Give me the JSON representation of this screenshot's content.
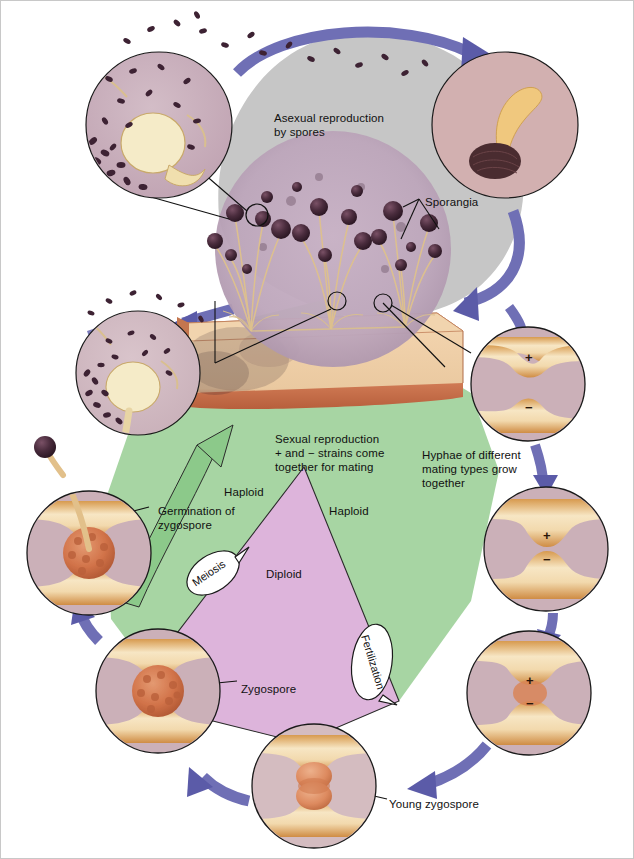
{
  "figure": {
    "title_visible": false,
    "background": "#ffffff",
    "border_color": "#c8c8c8"
  },
  "palette": {
    "asexual_field": "#c6c6c6",
    "sexual_field": "#a7d5a3",
    "diploid_field": "#ddb4db",
    "arrow_purple": "#6f6fb5",
    "arrow_green": "#8cc98a",
    "arrow_lavender": "#c6a9d6",
    "hypha_tan": "#e8b878",
    "hypha_light": "#f6e2bd",
    "zygospore_orange": "#d4724a",
    "sporangium_dark": "#3c2230",
    "bread_crust": "#cf7a57",
    "bread_crumb": "#f0cda8",
    "mold_mass": "#b9a1b4",
    "inset_fill": "#c6a8b8",
    "text": "#111111"
  },
  "labels": {
    "asexual": {
      "text": "Asexual reproduction\nby spores",
      "x": 273,
      "y": 110
    },
    "sporangia": {
      "text": "Sporangia",
      "x": 424,
      "y": 194
    },
    "sexual": {
      "text": "Sexual reproduction\n+ and − strains come\ntogether for mating",
      "x": 274,
      "y": 431
    },
    "hyphae_mating": {
      "text": "Hyphae of different\nmating types grow\ntogether",
      "x": 421,
      "y": 447
    },
    "haploid_left": {
      "text": "Haploid",
      "x": 223,
      "y": 484
    },
    "haploid_right": {
      "text": "Haploid",
      "x": 328,
      "y": 503
    },
    "diploid": {
      "text": "Diploid",
      "x": 265,
      "y": 566
    },
    "germination": {
      "text": "Germination of\nzygospore",
      "x": 157,
      "y": 503
    },
    "zygospore": {
      "text": "Zygospore",
      "x": 240,
      "y": 681
    },
    "young_zygospore": {
      "text": "Young zygospore",
      "x": 388,
      "y": 796
    }
  },
  "balloons": [
    {
      "name": "meiosis",
      "text": "Meiosis",
      "cx": 212,
      "cy": 572,
      "rx": 29,
      "ry": 18,
      "rotate": -34
    },
    {
      "name": "fertilization",
      "text": "Fertilization",
      "cx": 371,
      "cy": 661,
      "rx": 20,
      "ry": 38,
      "rotate": 73
    }
  ],
  "mating_signs": [
    {
      "name": "plus-sign-stage1",
      "symbol": "+",
      "x": 527,
      "y": 356
    },
    {
      "name": "minus-sign-stage1",
      "symbol": "−",
      "x": 527,
      "y": 406
    },
    {
      "name": "plus-sign-stage2",
      "symbol": "+",
      "x": 545,
      "y": 534
    },
    {
      "name": "minus-sign-stage2",
      "symbol": "−",
      "x": 545,
      "y": 558
    },
    {
      "name": "plus-sign-stage3",
      "symbol": "+",
      "x": 528,
      "y": 679
    },
    {
      "name": "minus-sign-stage3",
      "symbol": "−",
      "x": 528,
      "y": 702
    }
  ],
  "insets": [
    {
      "name": "inset-sporangium-bursting-top",
      "cx": 158,
      "cy": 124,
      "r": 73,
      "content": "ruptured sporangium releasing spores"
    },
    {
      "name": "inset-spore-germinating",
      "cx": 504,
      "cy": 124,
      "r": 73,
      "content": "germinating spore with germ tube"
    },
    {
      "name": "inset-sporangium-bursting-left",
      "cx": 137,
      "cy": 372,
      "r": 62,
      "content": "ruptured sporangium releasing spores"
    },
    {
      "name": "inset-mold-colony",
      "cx": 332,
      "cy": 248,
      "r": 118,
      "content": "sporangiophores bearing black sporangia on substrate"
    },
    {
      "name": "inset-hyphae-approach",
      "cx": 527,
      "cy": 383,
      "r": 57,
      "content": "plus and minus hyphae growing toward each other"
    },
    {
      "name": "inset-hyphae-contact",
      "cx": 545,
      "cy": 548,
      "r": 62,
      "content": "plus and minus hyphae in contact, gametangia forming"
    },
    {
      "name": "inset-fertilization",
      "cx": 528,
      "cy": 692,
      "r": 62,
      "content": "fusing gametangia at fertilization"
    },
    {
      "name": "inset-young-zygospore",
      "cx": 313,
      "cy": 785,
      "r": 62,
      "content": "young zygospore developing between suspensors"
    },
    {
      "name": "inset-zygospore",
      "cx": 157,
      "cy": 690,
      "r": 62,
      "content": "mature warty zygospore"
    },
    {
      "name": "inset-germinating-zygospore",
      "cx": 88,
      "cy": 552,
      "r": 62,
      "content": "germinating zygospore producing sporangiophore"
    }
  ],
  "cycle_arrows": [
    {
      "name": "arrow-asexual-top",
      "from": "sporangium burst",
      "to": "germinating spore",
      "color": "#6f6fb5"
    },
    {
      "name": "arrow-asexual-right-down",
      "from": "germinating spore",
      "to": "mold colony",
      "color": "#6f6fb5"
    },
    {
      "name": "arrow-colony-to-left-inset",
      "from": "colony",
      "to": "sporangium burst",
      "color": "#6f6fb5"
    },
    {
      "name": "arrow-sexual-right",
      "from": "colony",
      "to": "hyphae approach",
      "color": "#6f6fb5"
    },
    {
      "name": "arrow-to-contact",
      "from": "hyphae approach",
      "to": "hyphae contact",
      "color": "#6f6fb5"
    },
    {
      "name": "arrow-to-fertilization",
      "from": "hyphae contact",
      "to": "fertilization",
      "color": "#6f6fb5"
    },
    {
      "name": "arrow-to-young-zygospore",
      "from": "fertilization",
      "to": "young zygospore",
      "color": "#6f6fb5"
    },
    {
      "name": "arrow-to-zygospore",
      "from": "young zygospore",
      "to": "zygospore",
      "color": "#6f6fb5"
    },
    {
      "name": "arrow-to-germination",
      "from": "zygospore",
      "to": "germinating zygospore",
      "color": "#6f6fb5"
    },
    {
      "name": "arrow-germination-to-colony",
      "from": "germinating zygospore",
      "to": "colony",
      "color": "#6f6fb5"
    }
  ]
}
